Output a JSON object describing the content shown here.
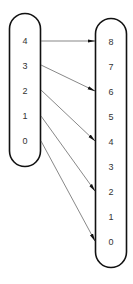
{
  "diagram": {
    "type": "mapping",
    "domain_set": {
      "labels": [
        "4",
        "3",
        "2",
        "1",
        "0"
      ]
    },
    "codomain_set": {
      "labels": [
        "8",
        "7",
        "6",
        "5",
        "4",
        "3",
        "2",
        "1",
        "0"
      ]
    },
    "arrows": [
      {
        "from": "4",
        "to": "8"
      },
      {
        "from": "3",
        "to": "6"
      },
      {
        "from": "2",
        "to": "4"
      },
      {
        "from": "1",
        "to": "2"
      },
      {
        "from": "0",
        "to": "0"
      }
    ],
    "colors": {
      "outline": "#111111",
      "arrow": "#555555",
      "arrowhead": "#111111",
      "text": "#333333",
      "background": "#ffffff"
    }
  }
}
